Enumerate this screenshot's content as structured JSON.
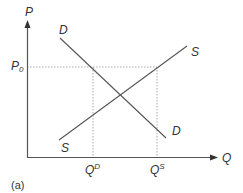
{
  "diagram": {
    "type": "supply-demand",
    "caption": "(a)",
    "axes": {
      "y_label": "P",
      "x_label": "Q"
    },
    "curves": [
      {
        "name": "D",
        "label_top": "D",
        "label_bottom": "D",
        "direction": "downward-sloping"
      },
      {
        "name": "S",
        "label_top": "S",
        "label_bottom": "S",
        "direction": "upward-sloping"
      }
    ],
    "price_level": {
      "label_base": "P",
      "label_sub": "0"
    },
    "quantities": [
      {
        "label_base": "Q",
        "label_sup": "D"
      },
      {
        "label_base": "Q",
        "label_sup": "S"
      }
    ],
    "colors": {
      "axis": "#555555",
      "curve": "#555555",
      "guide": "#aaaaaa",
      "text": "#333333"
    }
  }
}
